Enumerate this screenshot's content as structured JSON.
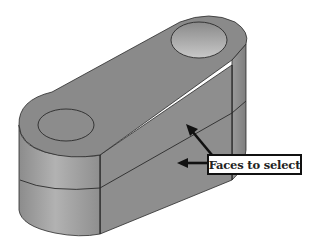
{
  "diagram": {
    "callout": {
      "label": "Faces to select",
      "arrows": 2
    },
    "colors": {
      "background": "#ffffff",
      "face_top": "#8a8a8a",
      "face_side": "#8e8e8e",
      "face_end": "#a0a0a0",
      "edge": "#2a2a2a",
      "hole_inner": "#b4b4b4",
      "arrow": "#111111"
    }
  }
}
